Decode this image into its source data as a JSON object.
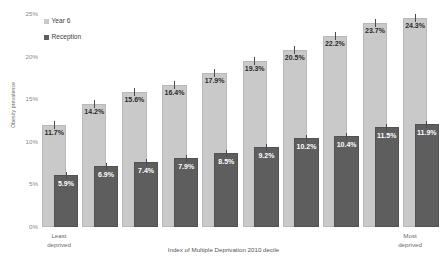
{
  "chart_data": {
    "type": "bar",
    "title": "",
    "subtitle": "",
    "xlabel": "Index of Multiple Deprivation 2010 decile",
    "ylabel": "Obesity prevalence",
    "categories": [
      "1",
      "2",
      "3",
      "4",
      "5",
      "6",
      "7",
      "8",
      "9",
      "10"
    ],
    "x_end_labels": {
      "left_line1": "Least",
      "left_line2": "deprived",
      "right_line1": "Most",
      "right_line2": "deprived"
    },
    "ylim": [
      0,
      25
    ],
    "y_ticks": [
      "0%",
      "5%",
      "10%",
      "15%",
      "20%",
      "25%"
    ],
    "y_tick_values": [
      0,
      5,
      10,
      15,
      20,
      25
    ],
    "grid": false,
    "legend_position": "top-left",
    "series": [
      {
        "name": "Year 6",
        "color": "#c9c9c9",
        "values": [
          11.7,
          14.2,
          15.6,
          16.4,
          17.9,
          19.3,
          20.5,
          22.2,
          23.7,
          24.3
        ],
        "labels": [
          "11.7%",
          "14.2%",
          "15.6%",
          "16.4%",
          "17.9%",
          "19.3%",
          "20.5%",
          "22.2%",
          "23.7%",
          "24.3%"
        ]
      },
      {
        "name": "Reception",
        "color": "#5e5e5e",
        "values": [
          5.9,
          6.9,
          7.4,
          7.9,
          8.5,
          9.2,
          10.2,
          10.4,
          11.5,
          11.9
        ],
        "labels": [
          "5.9%",
          "6.9%",
          "7.4%",
          "7.9%",
          "8.5%",
          "9.2%",
          "10.2%",
          "10.4%",
          "11.5%",
          "11.9%"
        ]
      }
    ],
    "error_bars": true
  },
  "legend": {
    "items": [
      {
        "label": "Year 6",
        "color": "#c9c9c9"
      },
      {
        "label": "Reception",
        "color": "#5e5e5e"
      }
    ]
  }
}
